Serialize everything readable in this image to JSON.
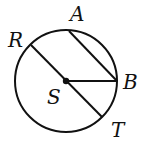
{
  "diagram": {
    "type": "circle-geometry",
    "circle": {
      "center": "S",
      "cx": 66,
      "cy": 81,
      "r": 51
    },
    "points": [
      {
        "name": "A",
        "x": 69,
        "y": 31,
        "label_x": 70,
        "label_y": 21
      },
      {
        "name": "R",
        "x": 31,
        "y": 45,
        "label_x": 8,
        "label_y": 47
      },
      {
        "name": "B",
        "x": 117,
        "y": 81,
        "label_x": 123,
        "label_y": 89
      },
      {
        "name": "S",
        "x": 66,
        "y": 81,
        "label_x": 47,
        "label_y": 104
      },
      {
        "name": "T",
        "x": 102,
        "y": 117,
        "label_x": 111,
        "label_y": 137
      }
    ],
    "segments": [
      {
        "name": "diameter-RT",
        "from": "R",
        "to": "T"
      },
      {
        "name": "chord-AB",
        "from": "A",
        "to": "B"
      },
      {
        "name": "radius-SB",
        "from": "S",
        "to": "B"
      }
    ],
    "labels": {
      "A": "A",
      "R": "R",
      "B": "B",
      "S": "S",
      "T": "T"
    },
    "colors": {
      "stroke": "#111111",
      "background": "#ffffff"
    }
  }
}
